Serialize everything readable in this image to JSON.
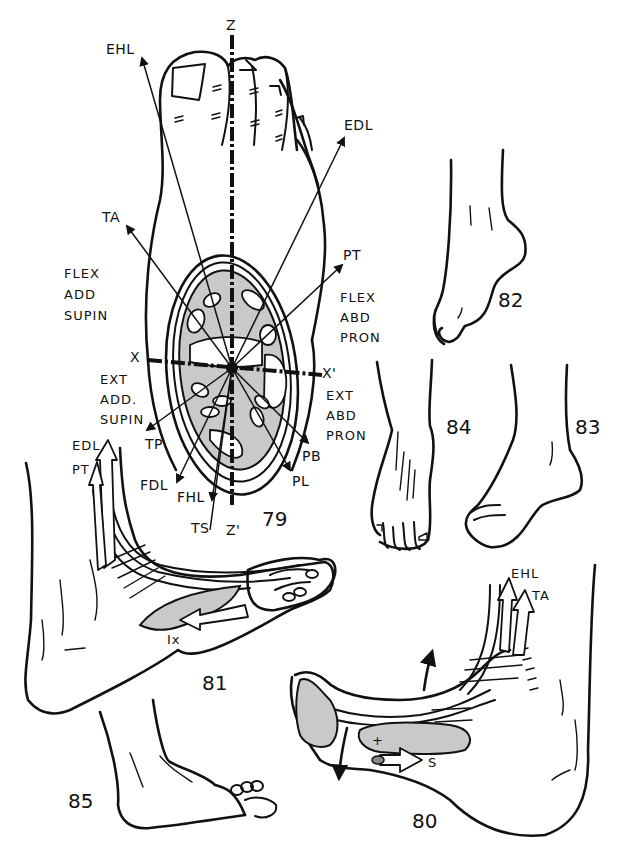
{
  "figure": {
    "colors": {
      "ink": "#111111",
      "background": "#ffffff",
      "shading": "#c9c9c9"
    }
  },
  "fig79": {
    "number": "79",
    "axes": {
      "z_top": "Z",
      "z_bottom": "Z'",
      "x_left": "X",
      "x_right": "X'"
    },
    "tendon_vectors": {
      "EHL": "EHL",
      "EDL": "EDL",
      "TA": "TA",
      "PT": "PT",
      "TP": "TP",
      "FDL": "FDL",
      "FHL": "FHL",
      "TS": "TS",
      "PB": "PB",
      "PL": "PL"
    },
    "quadrants": {
      "upper_left": [
        "FLEX",
        "ADD",
        "SUPIN"
      ],
      "upper_right": [
        "FLEX",
        "ABD",
        "PRON"
      ],
      "lower_left": [
        "EXT",
        "ADD.",
        "SUPIN"
      ],
      "lower_right": [
        "EXT",
        "ABD",
        "PRON"
      ]
    }
  },
  "fig80": {
    "number": "80",
    "labels": {
      "ehl": "EHL",
      "ta": "TA",
      "s": "S",
      "plus": "+"
    }
  },
  "fig81": {
    "number": "81",
    "labels": {
      "edl": "EDL",
      "pt": "PT",
      "ix": "Ix"
    }
  },
  "fig82": {
    "number": "82"
  },
  "fig83": {
    "number": "83"
  },
  "fig84": {
    "number": "84"
  },
  "fig85": {
    "number": "85"
  }
}
